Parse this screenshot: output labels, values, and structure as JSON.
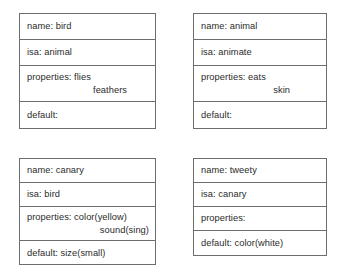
{
  "diagram": {
    "border_color": "#6d6d6d",
    "text_color": "#2b2b2b",
    "background_color": "#ffffff",
    "frames": [
      {
        "id": "bird",
        "rows": [
          {
            "label": "name: bird",
            "continuation": ""
          },
          {
            "label": "isa: animal",
            "continuation": ""
          },
          {
            "label": "properties: flies",
            "continuation": "feathers"
          },
          {
            "label": "default:",
            "continuation": ""
          }
        ]
      },
      {
        "id": "animal",
        "rows": [
          {
            "label": "name: animal",
            "continuation": ""
          },
          {
            "label": "isa: animate",
            "continuation": ""
          },
          {
            "label": "properties: eats",
            "continuation": "skin"
          },
          {
            "label": "default:",
            "continuation": ""
          }
        ]
      },
      {
        "id": "canary",
        "rows": [
          {
            "label": "name: canary",
            "continuation": ""
          },
          {
            "label": "isa: bird",
            "continuation": ""
          },
          {
            "label": "properties: color(yellow)",
            "continuation": "sound(sing)"
          },
          {
            "label": "default: size(small)",
            "continuation": ""
          }
        ]
      },
      {
        "id": "tweety",
        "rows": [
          {
            "label": "name: tweety",
            "continuation": ""
          },
          {
            "label": "isa: canary",
            "continuation": ""
          },
          {
            "label": "properties:",
            "continuation": ""
          },
          {
            "label": "default: color(white)",
            "continuation": ""
          }
        ]
      }
    ]
  }
}
